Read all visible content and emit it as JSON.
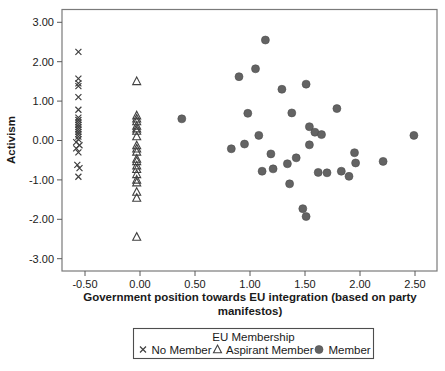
{
  "chart_data": {
    "type": "scatter",
    "title": "",
    "x_axis": {
      "label": "Government position towards EU integration (based on party manifestos)",
      "label_lines": [
        "Government position towards EU integration (based on party",
        "manifestos)"
      ],
      "tick_labels": [
        "-0.50",
        "0.00",
        "0.50",
        "1.00",
        "1.50",
        "2.00",
        "2.50"
      ],
      "tick_values": [
        -0.5,
        0.0,
        0.5,
        1.0,
        1.5,
        2.0,
        2.5
      ],
      "range": [
        -0.72,
        2.7
      ]
    },
    "y_axis": {
      "label": "Activism",
      "tick_labels": [
        "3.00",
        "2.00",
        "1.00",
        "0.00",
        "-1.00",
        "-2.00",
        "-3.00"
      ],
      "tick_values": [
        3.0,
        2.0,
        1.0,
        0.0,
        -1.0,
        -2.0,
        -3.0
      ],
      "range": [
        -3.33,
        3.33
      ]
    },
    "grid": false,
    "legend": {
      "title": "EU Membership",
      "position": "bottom"
    },
    "colors": {
      "marker_outline": "#404040",
      "circle_fill": "#636363",
      "frame": "#7a7a7a",
      "tick": "#595959"
    },
    "series": [
      {
        "name": "No Member",
        "marker": "cross",
        "color": "#404040",
        "points": [
          [
            -0.56,
            2.25
          ],
          [
            -0.56,
            1.57
          ],
          [
            -0.56,
            1.45
          ],
          [
            -0.56,
            1.38
          ],
          [
            -0.56,
            1.1
          ],
          [
            -0.56,
            0.78
          ],
          [
            -0.56,
            0.58
          ],
          [
            -0.56,
            0.52
          ],
          [
            -0.56,
            0.46
          ],
          [
            -0.56,
            0.4
          ],
          [
            -0.56,
            0.34
          ],
          [
            -0.56,
            0.28
          ],
          [
            -0.56,
            0.22
          ],
          [
            -0.56,
            0.16
          ],
          [
            -0.56,
            0.1
          ],
          [
            -0.56,
            0.03
          ],
          [
            -0.58,
            -0.04
          ],
          [
            -0.55,
            -0.12
          ],
          [
            -0.58,
            -0.2
          ],
          [
            -0.56,
            -0.3
          ],
          [
            -0.57,
            -0.62
          ],
          [
            -0.55,
            -0.7
          ],
          [
            -0.56,
            -0.92
          ]
        ]
      },
      {
        "name": "Aspirant Member",
        "marker": "open-triangle",
        "color": "#404040",
        "points": [
          [
            -0.03,
            1.5
          ],
          [
            -0.03,
            0.63
          ],
          [
            -0.03,
            0.55
          ],
          [
            -0.03,
            0.48
          ],
          [
            -0.03,
            0.37
          ],
          [
            -0.03,
            0.3
          ],
          [
            -0.03,
            0.24
          ],
          [
            -0.03,
            0.1
          ],
          [
            -0.03,
            -0.13
          ],
          [
            -0.03,
            -0.21
          ],
          [
            -0.03,
            -0.29
          ],
          [
            -0.03,
            -0.47
          ],
          [
            -0.03,
            -0.53
          ],
          [
            -0.03,
            -0.64
          ],
          [
            -0.03,
            -0.73
          ],
          [
            -0.03,
            -0.86
          ],
          [
            -0.03,
            -1.0
          ],
          [
            -0.03,
            -1.07
          ],
          [
            -0.03,
            -1.31
          ],
          [
            -0.03,
            -1.46
          ],
          [
            -0.03,
            -2.45
          ]
        ]
      },
      {
        "name": "Member",
        "marker": "filled-circle",
        "color": "#636363",
        "points": [
          [
            0.38,
            0.55
          ],
          [
            1.14,
            2.55
          ],
          [
            1.05,
            1.82
          ],
          [
            0.9,
            1.62
          ],
          [
            1.51,
            1.43
          ],
          [
            1.29,
            1.3
          ],
          [
            1.79,
            0.81
          ],
          [
            1.38,
            0.7
          ],
          [
            0.98,
            0.69
          ],
          [
            1.54,
            0.35
          ],
          [
            1.59,
            0.21
          ],
          [
            1.65,
            0.15
          ],
          [
            1.08,
            0.13
          ],
          [
            2.49,
            0.13
          ],
          [
            0.95,
            -0.09
          ],
          [
            1.54,
            -0.11
          ],
          [
            0.83,
            -0.21
          ],
          [
            1.19,
            -0.34
          ],
          [
            1.42,
            -0.44
          ],
          [
            1.34,
            -0.59
          ],
          [
            1.95,
            -0.31
          ],
          [
            1.96,
            -0.57
          ],
          [
            2.21,
            -0.53
          ],
          [
            1.11,
            -0.78
          ],
          [
            1.21,
            -0.72
          ],
          [
            1.62,
            -0.81
          ],
          [
            1.7,
            -0.82
          ],
          [
            1.83,
            -0.78
          ],
          [
            1.9,
            -0.91
          ],
          [
            1.36,
            -1.1
          ],
          [
            1.48,
            -1.73
          ],
          [
            1.51,
            -1.93
          ]
        ]
      }
    ]
  }
}
